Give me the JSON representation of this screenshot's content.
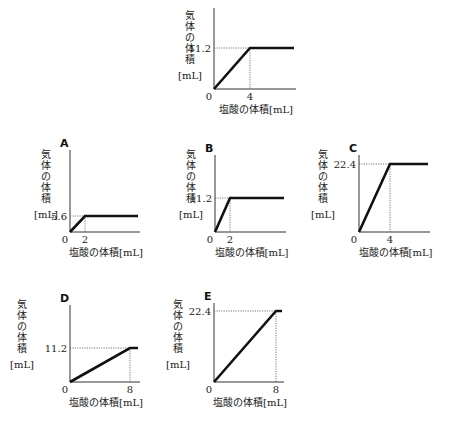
{
  "xlabel": "塩酸の体積[mL]",
  "ylabel_chars": [
    "気",
    "体",
    "の",
    "体",
    "積"
  ],
  "ylabel_unit": "[mL]",
  "origin_label": "0",
  "chart_data": [
    {
      "id": "reference",
      "type": "line",
      "panel_label": "",
      "x": [
        0,
        4,
        6.4
      ],
      "y": [
        0,
        11.2,
        11.2
      ],
      "xticks": [
        "0",
        "4"
      ],
      "yticks": [
        "11.2"
      ],
      "xlabel": "塩酸の体積[mL]",
      "ylabel": "気体の体積[mL]",
      "geom": {
        "ox": 214,
        "oy": 89,
        "top": 8,
        "xend": 294,
        "breakX": 250,
        "breakY": 48
      }
    },
    {
      "id": "A",
      "type": "line",
      "panel_label": "A",
      "x": [
        0,
        2,
        6.4
      ],
      "y": [
        0,
        5.6,
        5.6
      ],
      "xticks": [
        "0",
        "2"
      ],
      "yticks": [
        "5.6"
      ],
      "xlabel": "塩酸の体積[mL]",
      "ylabel": "気体の体積[mL]",
      "geom": {
        "ox": 70,
        "oy": 232,
        "top": 150,
        "xend": 138,
        "breakX": 85,
        "breakY": 216
      }
    },
    {
      "id": "B",
      "type": "line",
      "panel_label": "B",
      "x": [
        0,
        2,
        6.4
      ],
      "y": [
        0,
        11.2,
        11.2
      ],
      "xticks": [
        "0",
        "2"
      ],
      "yticks": [
        "11.2"
      ],
      "xlabel": "塩酸の体積[mL]",
      "ylabel": "気体の体積[mL]",
      "geom": {
        "ox": 215,
        "oy": 232,
        "top": 155,
        "xend": 284,
        "breakX": 230,
        "breakY": 198
      }
    },
    {
      "id": "C",
      "type": "line",
      "panel_label": "C",
      "x": [
        0,
        4,
        6.4
      ],
      "y": [
        0,
        22.4,
        22.4
      ],
      "xticks": [
        "0",
        "4"
      ],
      "yticks": [
        "22.4"
      ],
      "xlabel": "塩酸の体積[mL]",
      "ylabel": "気体の体積[mL]",
      "geom": {
        "ox": 359,
        "oy": 232,
        "top": 155,
        "xend": 428,
        "breakX": 390,
        "breakY": 164
      }
    },
    {
      "id": "D",
      "type": "line",
      "panel_label": "D",
      "x": [
        0,
        8,
        8.8
      ],
      "y": [
        0,
        11.2,
        11.2
      ],
      "xticks": [
        "0",
        "8"
      ],
      "yticks": [
        "11.2"
      ],
      "xlabel": "塩酸の体積[mL]",
      "ylabel": "気体の体積[mL]",
      "geom": {
        "ox": 70,
        "oy": 382,
        "top": 305,
        "xend": 138,
        "breakX": 130,
        "breakY": 348
      }
    },
    {
      "id": "E",
      "type": "line",
      "panel_label": "E",
      "x": [
        0,
        8,
        8.6
      ],
      "y": [
        0,
        22.4,
        22.4
      ],
      "xticks": [
        "0",
        "8"
      ],
      "yticks": [
        "22.4"
      ],
      "xlabel": "塩酸の体積[mL]",
      "ylabel": "気体の体積[mL]",
      "geom": {
        "ox": 214,
        "oy": 382,
        "top": 303,
        "xend": 282,
        "breakX": 276,
        "breakY": 311
      }
    }
  ]
}
